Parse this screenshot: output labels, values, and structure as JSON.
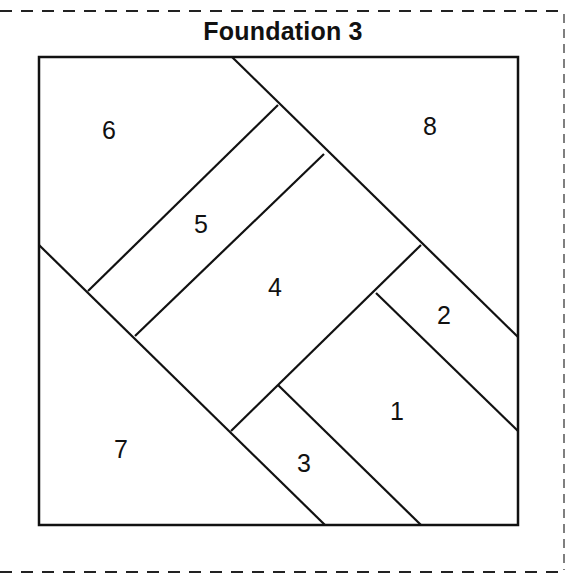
{
  "title": "Foundation 3",
  "colors": {
    "line": "#111111",
    "background": "#ffffff",
    "cutline": "#222222"
  },
  "pieces": [
    {
      "id": "1",
      "label": "1",
      "x": 397,
      "y": 411
    },
    {
      "id": "2",
      "label": "2",
      "x": 444,
      "y": 315
    },
    {
      "id": "3",
      "label": "3",
      "x": 304,
      "y": 463
    },
    {
      "id": "4",
      "label": "4",
      "x": 275,
      "y": 287
    },
    {
      "id": "5",
      "label": "5",
      "x": 201,
      "y": 224
    },
    {
      "id": "6",
      "label": "6",
      "x": 109,
      "y": 130
    },
    {
      "id": "7",
      "label": "7",
      "x": 121,
      "y": 449
    },
    {
      "id": "8",
      "label": "8",
      "x": 430,
      "y": 126
    }
  ]
}
